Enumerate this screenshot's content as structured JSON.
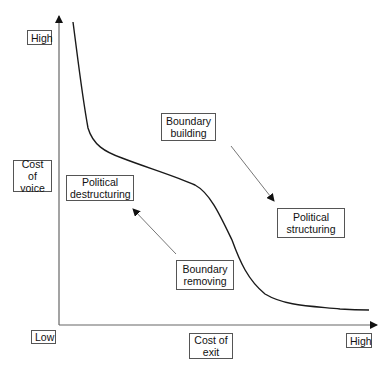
{
  "diagram": {
    "y_axis": {
      "name": "Cost of voice",
      "name_lines": [
        "Cost of",
        "voice"
      ],
      "high_label": "High"
    },
    "x_axis": {
      "name": "Cost of exit",
      "name_lines": [
        "Cost of",
        "exit"
      ],
      "high_label": "High"
    },
    "origin_label": "Low",
    "regions": [
      {
        "id": "political-destructuring",
        "lines": [
          "Political",
          "destructuring"
        ]
      },
      {
        "id": "political-structuring",
        "lines": [
          "Political",
          "structuring"
        ]
      }
    ],
    "processes": [
      {
        "id": "boundary-building",
        "lines": [
          "Boundary",
          "building"
        ],
        "direction": "toward political structuring"
      },
      {
        "id": "boundary-removing",
        "lines": [
          "Boundary",
          "removing"
        ],
        "direction": "toward political destructuring"
      }
    ],
    "curve": {
      "description": "Downward-sloping boundary curve from high voice cost / low exit cost to low voice cost / high exit cost",
      "color": "#1a1a1a"
    },
    "colors": {
      "axis": "#666666",
      "arrow": "#777777",
      "curve": "#1a1a1a",
      "box_border": "#555555"
    }
  }
}
